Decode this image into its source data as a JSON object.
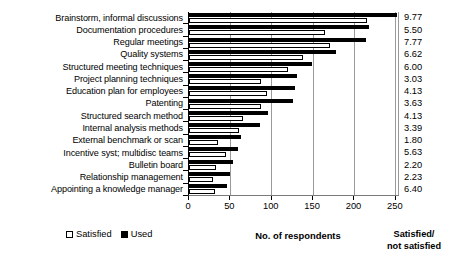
{
  "chart_data": {
    "type": "bar",
    "orientation": "horizontal",
    "title": "",
    "xlabel": "No. of respondents",
    "ylabel": "",
    "xlim": [
      0,
      255
    ],
    "xticks": [
      0,
      50,
      100,
      150,
      200,
      250
    ],
    "xtick_labels": [
      "0",
      "50",
      "100",
      "150",
      "200",
      "250"
    ],
    "grid": true,
    "legend_position": "bottom-left",
    "categories": [
      "Brainstorm, informal discussions",
      "Documentation procedures",
      "Regular meetings",
      "Quality systems",
      "Structured meeting techniques",
      "Project planning techniques",
      "Education plan for employees",
      "Patenting",
      "Structured search method",
      "Internal analysis methods",
      "External benchmark or scan",
      "Incentive syst; multidisc teams",
      "Bulletin board",
      "Relationship management",
      "Appointing a knowledge manager"
    ],
    "series": [
      {
        "name": "Used",
        "color": "#000000",
        "values": [
          252,
          219,
          215,
          179,
          149,
          131,
          129,
          126,
          96,
          86,
          63,
          59,
          54,
          50,
          46
        ]
      },
      {
        "name": "Satisfied",
        "color": "#ffffff",
        "values": [
          216,
          165,
          171,
          138,
          120,
          88,
          95,
          87,
          66,
          61,
          35,
          45,
          33,
          29,
          32
        ]
      }
    ],
    "annotation_column": {
      "header_lines": [
        "Satisfied/",
        "not satisfied"
      ],
      "values": [
        "9.77",
        "5.50",
        "7.77",
        "6.62",
        "6.00",
        "3.03",
        "4.13",
        "3.63",
        "4.13",
        "3.39",
        "1.80",
        "5.63",
        "2.20",
        "2.23",
        "6.40"
      ]
    }
  },
  "legend": {
    "items": [
      {
        "label": "Satisfied",
        "icon": "hollow-square-icon"
      },
      {
        "label": "Used",
        "icon": "filled-square-icon"
      }
    ]
  }
}
